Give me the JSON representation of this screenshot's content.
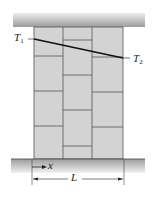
{
  "figure": {
    "labels": {
      "t1": {
        "main": "T",
        "sub": "1"
      },
      "t2": {
        "main": "T",
        "sub": "2"
      },
      "x": "x",
      "L": "L"
    },
    "colors": {
      "slab_top": "#e6e6e6",
      "slab_bottom": "#9a9a9a",
      "brick": "#d3d3d3",
      "mortar": "#555555",
      "line": "#111111"
    }
  }
}
